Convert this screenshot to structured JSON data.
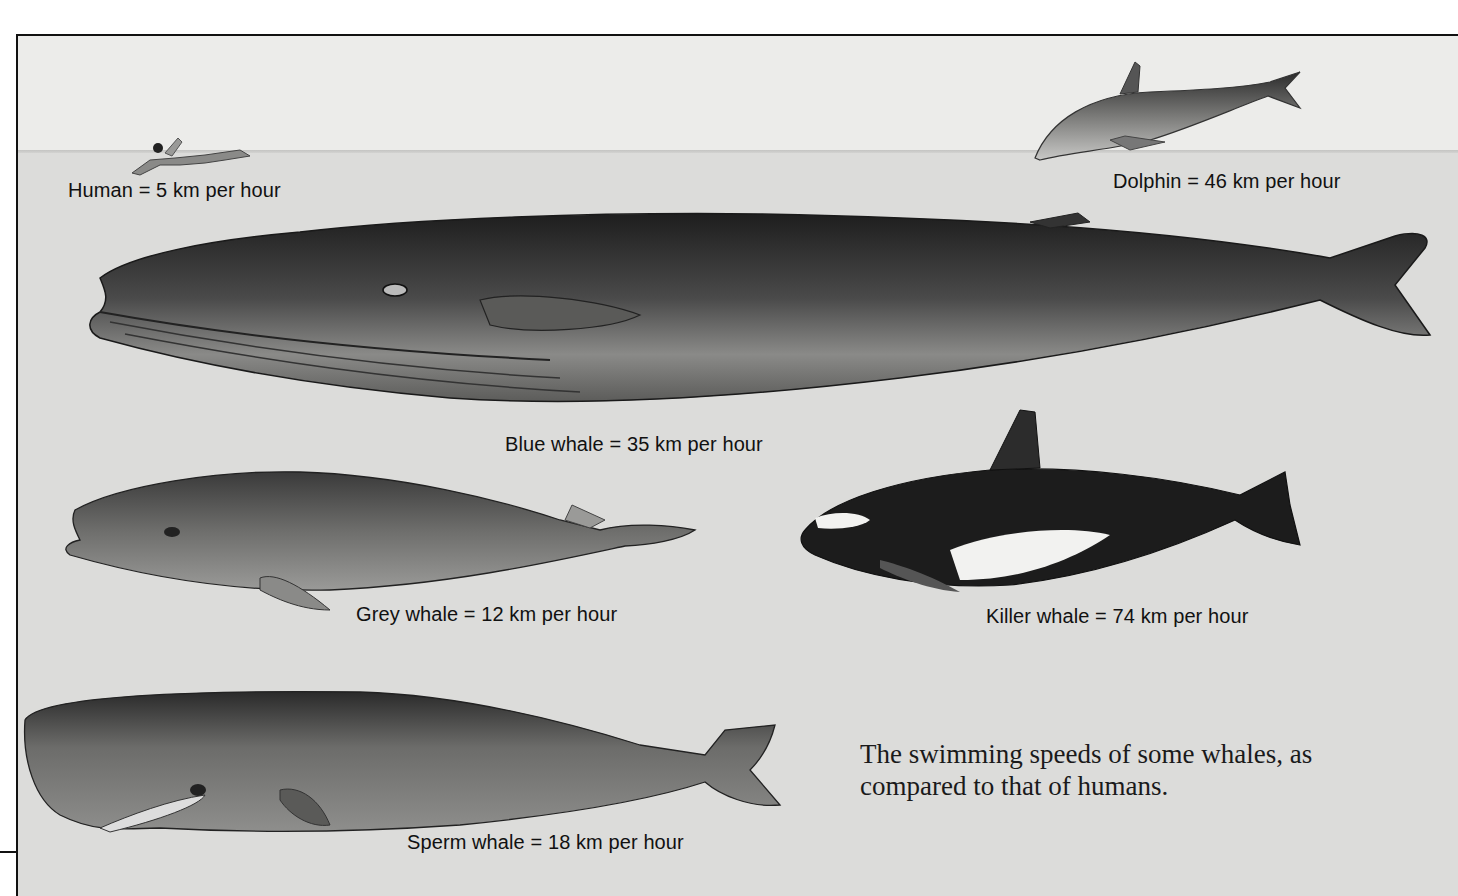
{
  "figure": {
    "caption": "The swimming speeds of some whales, as compared to that of humans.",
    "labels": {
      "human": "Human = 5 km per hour",
      "dolphin": "Dolphin = 46 km per hour",
      "blue_whale": "Blue whale = 35 km per hour",
      "grey_whale": "Grey whale = 12 km per hour",
      "killer_whale": "Killer whale = 74 km per hour",
      "sperm_whale": "Sperm whale = 18 km per hour"
    },
    "animals": [
      {
        "name": "Human",
        "speed_kmh": 5,
        "icon": "swimmer-illustration"
      },
      {
        "name": "Dolphin",
        "speed_kmh": 46,
        "icon": "dolphin-illustration"
      },
      {
        "name": "Blue whale",
        "speed_kmh": 35,
        "icon": "blue-whale-illustration"
      },
      {
        "name": "Grey whale",
        "speed_kmh": 12,
        "icon": "grey-whale-illustration"
      },
      {
        "name": "Killer whale",
        "speed_kmh": 74,
        "icon": "killer-whale-illustration"
      },
      {
        "name": "Sperm whale",
        "speed_kmh": 18,
        "icon": "sperm-whale-illustration"
      }
    ],
    "colors": {
      "background": "#e9e9e7",
      "sea": "#dcdcda",
      "ink": "#111111"
    }
  }
}
